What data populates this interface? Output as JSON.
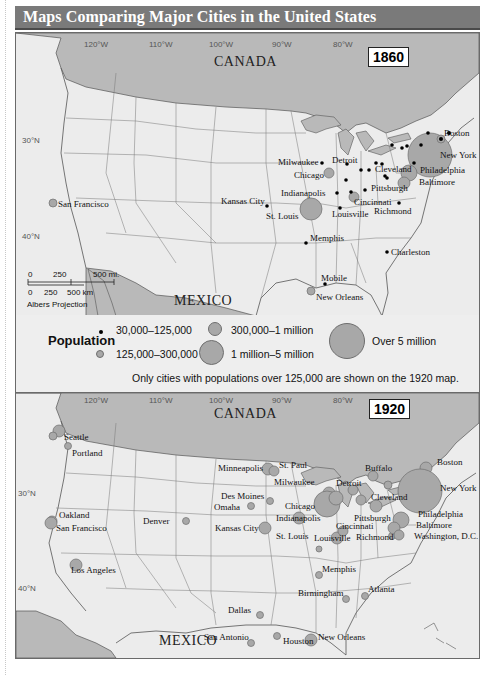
{
  "title": "Maps Comparing Major Cities in the United States",
  "colors": {
    "title_bar": "#7a7a7a",
    "land": "#ececec",
    "foreign_land": "#b9b9b9",
    "city_circle": "#a8a8a8",
    "city_dot": "#000000"
  },
  "map_1860": {
    "year": "1860",
    "country_north": "CANADA",
    "country_south": "MEXICO",
    "longitudes": [
      "120°W",
      "110°W",
      "100°W",
      "90°W",
      "80°W"
    ],
    "latitudes": [
      "30°N",
      "40°N"
    ],
    "scale": {
      "miles": [
        "0",
        "250",
        "500 mi."
      ],
      "km": [
        "0",
        "250",
        "500 km"
      ],
      "projection": "Albers Projection"
    },
    "cities": [
      {
        "name": "Boston",
        "size": "medium",
        "x": 422,
        "y": 105
      },
      {
        "name": "New York",
        "size": "xlarge",
        "x": 408,
        "y": 127
      },
      {
        "name": "Philadelphia",
        "size": "medium",
        "x": 402,
        "y": 141
      },
      {
        "name": "Baltimore",
        "size": "small",
        "x": 396,
        "y": 150
      },
      {
        "name": "Milwaukee",
        "size": "dot",
        "x": 310,
        "y": 130
      },
      {
        "name": "Detroit",
        "size": "dot",
        "x": 345,
        "y": 131
      },
      {
        "name": "Chicago",
        "size": "small",
        "x": 313,
        "y": 140
      },
      {
        "name": "Cleveland",
        "size": "dot",
        "x": 359,
        "y": 137
      },
      {
        "name": "Indianapolis",
        "size": "dot",
        "x": 328,
        "y": 160
      },
      {
        "name": "Kansas City",
        "size": "dot",
        "x": 251,
        "y": 172
      },
      {
        "name": "St. Louis",
        "size": "medium",
        "x": 297,
        "y": 175
      },
      {
        "name": "Pittsburgh",
        "size": "dot",
        "x": 372,
        "y": 145
      },
      {
        "name": "Cincinnati",
        "size": "small",
        "x": 342,
        "y": 165
      },
      {
        "name": "Louisville",
        "size": "dot",
        "x": 334,
        "y": 175
      },
      {
        "name": "Richmond",
        "size": "dot",
        "x": 397,
        "y": 170
      },
      {
        "name": "San Francisco",
        "size": "small",
        "x": 52,
        "y": 168
      },
      {
        "name": "Memphis",
        "size": "dot",
        "x": 304,
        "y": 210
      },
      {
        "name": "Charleston",
        "size": "dot",
        "x": 387,
        "y": 220
      },
      {
        "name": "Mobile",
        "size": "dot",
        "x": 324,
        "y": 250
      },
      {
        "name": "New Orleans",
        "size": "small",
        "x": 309,
        "y": 260
      }
    ]
  },
  "legend": {
    "heading": "Population",
    "items": [
      {
        "label": "30,000–125,000",
        "size": "dot"
      },
      {
        "label": "125,000–300,000",
        "size": "small"
      },
      {
        "label": "300,000–1 million",
        "size": "medium"
      },
      {
        "label": "1 million–5 million",
        "size": "large"
      },
      {
        "label": "Over 5 million",
        "size": "xlarge"
      }
    ],
    "note": "Only cities with populations over 125,000 are shown on the 1920 map."
  },
  "map_1920": {
    "year": "1920",
    "country_north": "CANADA",
    "country_south": "MEXICO",
    "longitudes": [
      "120°W",
      "110°W",
      "100°W",
      "90°W",
      "80°W"
    ],
    "latitudes": [
      "30°N",
      "40°N"
    ],
    "cities": [
      {
        "name": "Seattle",
        "size": "medium"
      },
      {
        "name": "Portland",
        "size": "small"
      },
      {
        "name": "Oakland",
        "size": "small"
      },
      {
        "name": "San Francisco",
        "size": "medium"
      },
      {
        "name": "Los Angeles",
        "size": "medium"
      },
      {
        "name": "Denver",
        "size": "small"
      },
      {
        "name": "Minneapolis",
        "size": "medium"
      },
      {
        "name": "St. Paul",
        "size": "medium"
      },
      {
        "name": "Des Moines",
        "size": "small"
      },
      {
        "name": "Omaha",
        "size": "small"
      },
      {
        "name": "Kansas City",
        "size": "medium"
      },
      {
        "name": "Milwaukee",
        "size": "medium"
      },
      {
        "name": "Chicago",
        "size": "large"
      },
      {
        "name": "St. Louis",
        "size": "medium"
      },
      {
        "name": "Indianapolis",
        "size": "medium"
      },
      {
        "name": "Detroit",
        "size": "medium"
      },
      {
        "name": "Buffalo",
        "size": "medium"
      },
      {
        "name": "Cleveland",
        "size": "medium"
      },
      {
        "name": "Pittsburgh",
        "size": "medium"
      },
      {
        "name": "Cincinnati",
        "size": "medium"
      },
      {
        "name": "Louisville",
        "size": "small"
      },
      {
        "name": "Richmond",
        "size": "small"
      },
      {
        "name": "Boston",
        "size": "medium"
      },
      {
        "name": "New York",
        "size": "xlarge"
      },
      {
        "name": "Philadelphia",
        "size": "large"
      },
      {
        "name": "Baltimore",
        "size": "medium"
      },
      {
        "name": "Washington, D.C.",
        "size": "medium"
      },
      {
        "name": "Memphis",
        "size": "small"
      },
      {
        "name": "Birmingham",
        "size": "small"
      },
      {
        "name": "Atlanta",
        "size": "small"
      },
      {
        "name": "Dallas",
        "size": "small"
      },
      {
        "name": "San Antonio",
        "size": "small"
      },
      {
        "name": "Houston",
        "size": "small"
      },
      {
        "name": "New Orleans",
        "size": "medium"
      }
    ]
  }
}
